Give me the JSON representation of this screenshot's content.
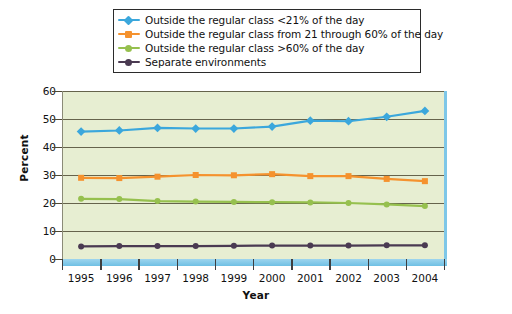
{
  "chart_data": {
    "type": "line",
    "title": "",
    "xlabel": "Year",
    "ylabel": "Percent",
    "categories": [
      "1995",
      "1996",
      "1997",
      "1998",
      "1999",
      "2000",
      "2001",
      "2002",
      "2003",
      "2004"
    ],
    "x": [
      1995,
      1996,
      1997,
      1998,
      1999,
      2000,
      2001,
      2002,
      2003,
      2004
    ],
    "ylim": [
      0,
      60
    ],
    "yticks": [
      0,
      10,
      20,
      30,
      40,
      50,
      60
    ],
    "ytick_labels": [
      "0",
      "10",
      "20",
      "30",
      "40",
      "50",
      "60"
    ],
    "grid": "horizontal",
    "legend_position": "top",
    "plot_background": "#e7eed2",
    "series": [
      {
        "name": "Outside the regular class <21% of the day",
        "color": "#3ba7dc",
        "marker": "diamond",
        "values": [
          45.5,
          45.9,
          46.8,
          46.6,
          46.6,
          47.3,
          49.4,
          49.2,
          50.8,
          52.9
        ]
      },
      {
        "name": "Outside the regular class from 21 through 60% of the day",
        "color": "#f5922e",
        "marker": "square",
        "values": [
          29.0,
          28.9,
          29.4,
          30.0,
          29.9,
          30.3,
          29.6,
          29.6,
          28.6,
          27.8
        ]
      },
      {
        "name": "Outside the regular class >60% of the day",
        "color": "#96c04e",
        "marker": "circle",
        "values": [
          21.5,
          21.4,
          20.7,
          20.5,
          20.4,
          20.3,
          20.2,
          20.0,
          19.5,
          18.9
        ]
      },
      {
        "name": "Separate environments",
        "color": "#4a3a52",
        "marker": "circle",
        "values": [
          4.5,
          4.6,
          4.6,
          4.6,
          4.7,
          4.8,
          4.8,
          4.8,
          4.9,
          4.9
        ]
      }
    ]
  },
  "legend": {
    "items": [
      {
        "label": "Outside the regular class <21% of the day",
        "color": "#3ba7dc",
        "marker": "diamond"
      },
      {
        "label": "Outside the regular class from 21 through 60% of the day",
        "color": "#f5922e",
        "marker": "square"
      },
      {
        "label": "Outside the regular class >60% of the day",
        "color": "#96c04e",
        "marker": "circle"
      },
      {
        "label": "Separate environments",
        "color": "#4a3a52",
        "marker": "circle"
      }
    ]
  },
  "axes": {
    "y_title": "Percent",
    "x_title": "Year"
  }
}
